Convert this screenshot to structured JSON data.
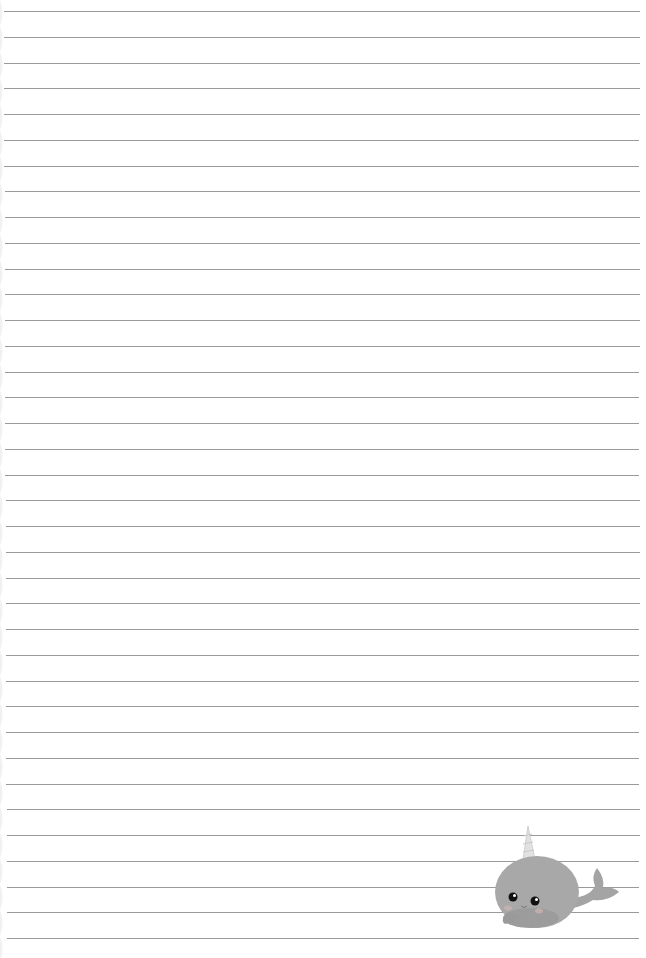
{
  "page": {
    "type": "lined-paper",
    "background": "#ffffff",
    "line_color": "#9a9a9a",
    "line_count": 37,
    "first_line_y": 11,
    "line_spacing": 25.75,
    "line_left": 4,
    "line_right": 640
  },
  "decoration": {
    "name": "narwhal",
    "body_color": "#a8a8a8",
    "horn_color": "#e2e2e2",
    "cheek_color": "#c9b3b3"
  }
}
